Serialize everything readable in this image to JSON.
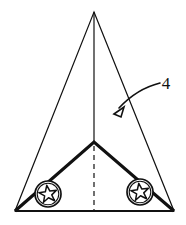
{
  "figure": {
    "background_color": "#ffffff",
    "ink_color": "#111111",
    "width": 186,
    "height": 225,
    "callouts": [
      {
        "label": "4",
        "text_x": 166,
        "text_y": 89,
        "leader_path": "M 160 83 C 148 86 132 94 119 108",
        "arrow_tip_x": 114,
        "arrow_tip_y": 114,
        "arrow_points": "114,114 124,107 121,117"
      }
    ],
    "outer_triangle": {
      "apex_x": 94,
      "apex_y": 12,
      "left_x": 15,
      "left_y": 211,
      "right_x": 174,
      "right_y": 211,
      "stroke_width": 1.2,
      "points": "94,12 174,211 15,211"
    },
    "inner_vee": {
      "apex_x": 94,
      "apex_y": 142,
      "left_x": 15,
      "left_y": 211,
      "right_x": 174,
      "right_y": 211,
      "stroke_width": 3.2,
      "path": "M 15 211 L 94 142 L 174 211"
    },
    "center_line": {
      "solid_top_x": 94,
      "solid_top_y": 12,
      "solid_bottom_x": 94,
      "solid_bottom_y": 142,
      "dashed_top_x": 94,
      "dashed_top_y": 146,
      "dashed_bottom_x": 94,
      "dashed_bottom_y": 211,
      "dash_pattern": "5,4",
      "stroke_width": 1.2
    },
    "baseline": {
      "x1": 15,
      "y1": 211,
      "x2": 174,
      "y2": 211,
      "stroke_width": 2.0
    },
    "wheels": [
      {
        "name": "left-wheel",
        "cx": 48,
        "cy": 194,
        "outer_radius": 13,
        "inner_radius": 11,
        "star_radius": 9,
        "star_inner_radius": 3.9,
        "star_rotation": -8,
        "stroke_width": 1.6
      },
      {
        "name": "right-wheel",
        "cx": 140,
        "cy": 192,
        "outer_radius": 13,
        "inner_radius": 11,
        "star_radius": 9,
        "star_inner_radius": 3.9,
        "star_rotation": -8,
        "stroke_width": 1.6
      }
    ]
  }
}
